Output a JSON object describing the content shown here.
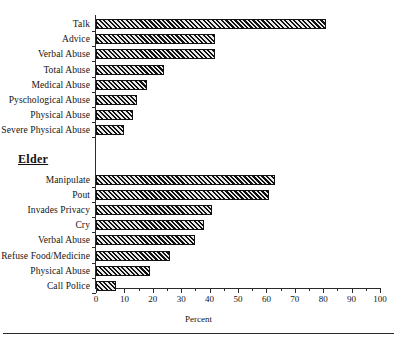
{
  "chart_data": {
    "type": "bar",
    "orientation": "horizontal",
    "title": "",
    "xlabel": "Percent",
    "ylabel": "",
    "xlim": [
      0,
      100
    ],
    "xticks": [
      0,
      10,
      20,
      30,
      40,
      50,
      60,
      70,
      80,
      90,
      100
    ],
    "xtick_labels": [
      "0",
      "10",
      "20",
      "30",
      "40",
      "50",
      "60",
      "70",
      "80",
      "90",
      "100"
    ],
    "minor_ticks": true,
    "grid": false,
    "legend": false,
    "bar_style": "diagonal-hatch",
    "groups": [
      {
        "heading": "",
        "categories": [
          "Talk",
          "Advice",
          "Verbal Abuse",
          "Total Abuse",
          "Medical Abuse",
          "Pyschological Abuse",
          "Physical Abuse",
          "Severe Physical Abuse"
        ],
        "values": [
          81,
          42,
          42,
          24,
          18,
          14.5,
          13,
          10
        ]
      },
      {
        "heading": "Elder",
        "categories": [
          "Manipulate",
          "Pout",
          "Invades Privacy",
          "Cry",
          "Verbal Abuse",
          "Refuse Food/Medicine",
          "Physical Abuse",
          "Call Police"
        ],
        "values": [
          63,
          61,
          41,
          38,
          35,
          26,
          19,
          7
        ]
      }
    ]
  },
  "colors": {
    "axis": "#2b2b2b",
    "bar_dark": "#111111",
    "bar_light": "#e9e9e9",
    "text": "#141414"
  }
}
